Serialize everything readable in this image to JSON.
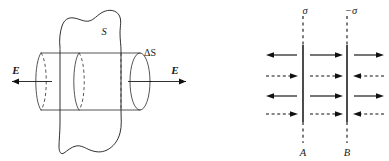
{
  "figure": {
    "background_color": "#ffffff",
    "ink_color": "#111111",
    "width": 389,
    "height": 161
  },
  "panel_left": {
    "name": "gaussian-cylinder-through-surface",
    "surface_label": "S",
    "element_label": "ΔS",
    "field_label_left": "E",
    "field_label_right": "E",
    "field_direction_left": "left",
    "field_direction_right": "right",
    "description": "Irregular closed surface S pierced by a horizontal cylinder of cross-section ΔS with field E emerging on both sides"
  },
  "panel_right": {
    "name": "parallel-charged-plates",
    "plate_a": {
      "label": "A",
      "charge_label": "σ",
      "x": 303
    },
    "plate_b": {
      "label": "B",
      "charge_label": "−σ",
      "x": 347
    },
    "regions": [
      "left-of-A",
      "between-A-and-B",
      "right-of-B"
    ],
    "rows": [
      {
        "index": 1,
        "style": "solid",
        "directions": [
          "left",
          "right",
          "right"
        ]
      },
      {
        "index": 2,
        "style": "dashed",
        "directions": [
          "right",
          "right",
          "left"
        ]
      },
      {
        "index": 3,
        "style": "solid",
        "directions": [
          "left",
          "right",
          "right"
        ]
      },
      {
        "index": 4,
        "style": "dashed",
        "directions": [
          "right",
          "right",
          "left"
        ]
      }
    ],
    "description": "Two vertical plates A and B carrying surface charge densities sigma and minus sigma, with solid and dashed field arrows in three regions"
  }
}
